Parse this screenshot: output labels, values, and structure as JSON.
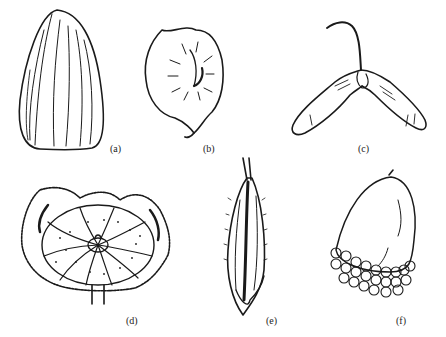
{
  "figure": {
    "panels": [
      {
        "id": "a",
        "label": "(a)",
        "subject": "ribbed ovoid seed"
      },
      {
        "id": "b",
        "label": "(b)",
        "subject": "winged disc fruit (samara, round)"
      },
      {
        "id": "c",
        "label": "(c)",
        "subject": "double samara (maple key)"
      },
      {
        "id": "d",
        "label": "(d)",
        "subject": "lobed schizocarp with hairy calyx"
      },
      {
        "id": "e",
        "label": "(e)",
        "subject": "grass floret / awned grain"
      },
      {
        "id": "f",
        "label": "(f)",
        "subject": "acorn with scaly cupule"
      }
    ],
    "colors": {
      "ink": "#1a1a1a",
      "paper": "#ffffff"
    }
  }
}
